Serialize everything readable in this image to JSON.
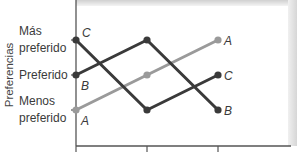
{
  "chart_data": {
    "type": "line",
    "title": "",
    "xlabel": "",
    "ylabel": "Preferencias",
    "x": [
      1,
      2,
      3
    ],
    "x_tick_labels": [
      "",
      "",
      ""
    ],
    "y_levels": [
      1,
      2,
      3
    ],
    "y_tick_labels": [
      {
        "value": 3,
        "lines": [
          "Más",
          "preferido"
        ]
      },
      {
        "value": 2,
        "lines": [
          "Preferido"
        ]
      },
      {
        "value": 1,
        "lines": [
          "Menos",
          "preferido"
        ]
      }
    ],
    "ylim": [
      0.5,
      3.5
    ],
    "grid": false,
    "legend": "none",
    "series": [
      {
        "name": "C",
        "values": [
          3,
          1,
          2
        ],
        "color": "#3a3a3a"
      },
      {
        "name": "B",
        "values": [
          2,
          3,
          1
        ],
        "color": "#3a3a3a"
      },
      {
        "name": "A",
        "values": [
          1,
          2,
          3
        ],
        "color": "#9a9a9a"
      }
    ],
    "annotations": [
      {
        "text": "C",
        "series": "C",
        "at_x": 1,
        "side": "right-above"
      },
      {
        "text": "B",
        "series": "B",
        "at_x": 1,
        "side": "right-below"
      },
      {
        "text": "A",
        "series": "A",
        "at_x": 1,
        "side": "right-below"
      },
      {
        "text": "A",
        "series": "A",
        "at_x": 3,
        "side": "right"
      },
      {
        "text": "C",
        "series": "C",
        "at_x": 3,
        "side": "right"
      },
      {
        "text": "B",
        "series": "B",
        "at_x": 3,
        "side": "right"
      }
    ]
  }
}
